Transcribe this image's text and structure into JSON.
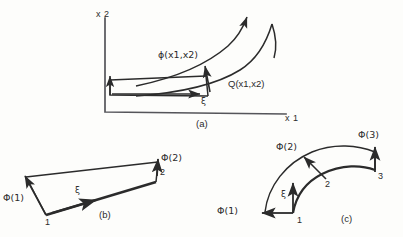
{
  "figure": {
    "stroke_color": "#2b2b2b",
    "background_color": "#fdfdfb"
  },
  "panel_a": {
    "caption": "(a)",
    "axis_x": "x 1",
    "axis_y": "x 2",
    "label_phi": "ϕ(x1,x2)",
    "label_q": "Q(x1,x2)",
    "label_xi": "ξ"
  },
  "panel_b": {
    "caption": "(b)",
    "node_1": "1",
    "node_2": "2",
    "label_phi1": "Φ(1)",
    "label_phi2": "Φ(2)",
    "label_xi": "ξ"
  },
  "panel_c": {
    "caption": "(c)",
    "node_1": "1",
    "node_2": "2",
    "node_3": "3",
    "label_phi1": "Φ(1)",
    "label_phi2": "Φ(2)",
    "label_phi3": "Φ(3)",
    "label_xi": "ξ"
  }
}
